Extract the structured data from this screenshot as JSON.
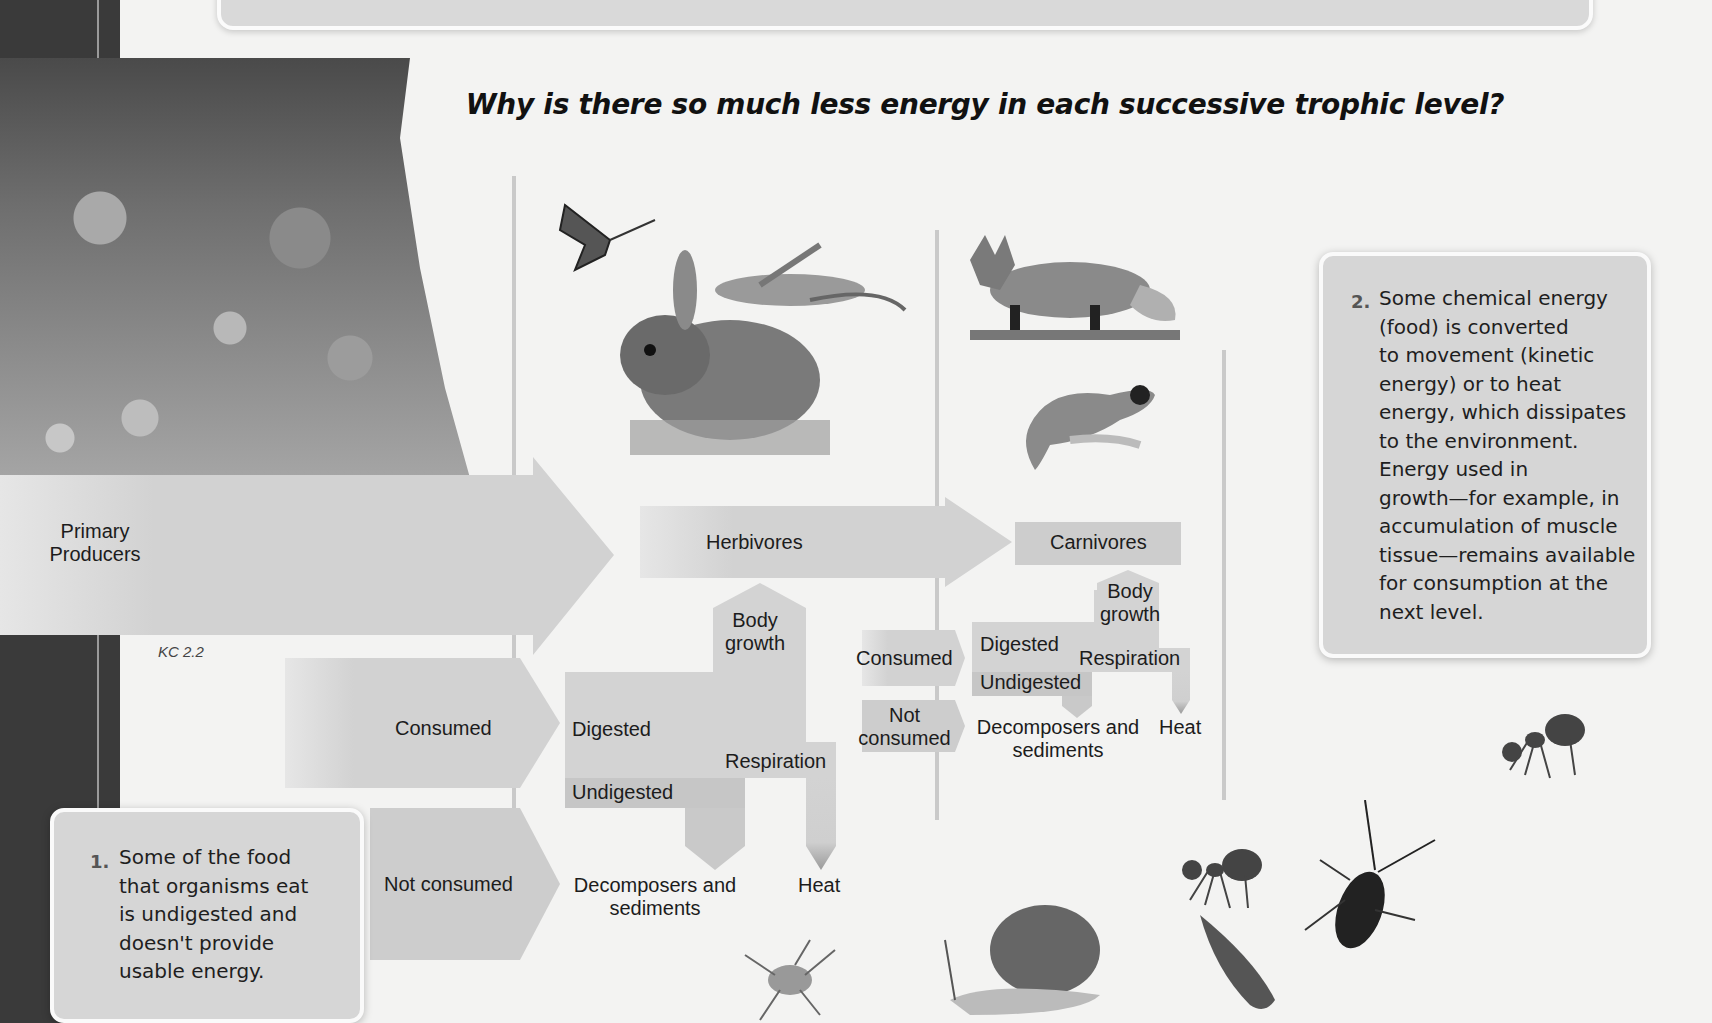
{
  "page": {
    "title": "Why is there so much less energy in each successive trophic level?",
    "figure_ref": "KC 2.2"
  },
  "diagram": {
    "primary_producers": "Primary\nProducers",
    "herbivores": "Herbivores",
    "carnivores": "Carnivores",
    "producer_branch": {
      "consumed": "Consumed",
      "not_consumed": "Not consumed"
    },
    "herbivore_branch": {
      "body_growth": "Body\ngrowth",
      "digested": "Digested",
      "undigested": "Undigested",
      "respiration": "Respiration",
      "decomposers": "Decomposers and\nsediments",
      "heat": "Heat",
      "consumed": "Consumed",
      "not_consumed": "Not\nconsumed"
    },
    "carnivore_branch": {
      "body_growth": "Body\ngrowth",
      "digested": "Digested",
      "undigested": "Undigested",
      "respiration": "Respiration",
      "decomposers": "Decomposers and\nsediments",
      "heat": "Heat"
    }
  },
  "callouts": [
    {
      "number": "1.",
      "text": "Some of the food\nthat organisms eat\nis undigested and\ndoesn't provide\nusable energy."
    },
    {
      "number": "2.",
      "text": "Some chemical energy\n(food) is converted\nto movement (kinetic\nenergy) or to heat\nenergy, which dissipates\nto the environment.\nEnergy used in\ngrowth—for example, in\naccumulation of muscle\ntissue—remains available\nfor consumption at the\nnext level."
    }
  ],
  "illustrations": {
    "producers": "wildflower-meadow-photo",
    "herbivores": [
      "monarch-butterfly",
      "grasshopper",
      "rabbit"
    ],
    "carnivores": [
      "red-fox",
      "black-footed-ferret"
    ],
    "decomposers": [
      "ant",
      "ant",
      "beetle",
      "leafhopper",
      "snail",
      "springtail"
    ]
  },
  "colors": {
    "background": "#f3f3f2",
    "arrow_fill": "#d3d3d3",
    "arrow_dark": "#c4c4c4",
    "sidebar": "#3a3a3a",
    "callout_fill": "#d6d6d6"
  }
}
